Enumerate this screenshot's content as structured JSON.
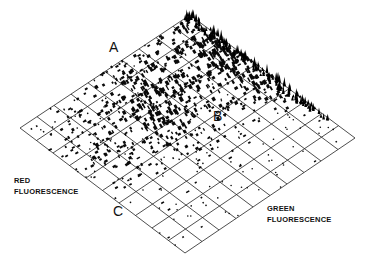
{
  "chart_data": {
    "type": "heatmap",
    "subtype": "3d-isometric-histogram",
    "title": "",
    "xlabel": "GREEN FLUORESCENCE",
    "ylabel": "RED FLUORESCENCE",
    "grid": true,
    "grid_divisions": 10,
    "annotations": [
      {
        "label": "A",
        "description": "ridge of high counts along high red fluorescence edge"
      },
      {
        "label": "B",
        "description": "population toward higher green fluorescence"
      },
      {
        "label": "C",
        "description": "low-count tail near low red fluorescence edge"
      }
    ],
    "colors": {
      "ink": "#111111",
      "background": "#ffffff"
    }
  },
  "labels": {
    "a": "A",
    "b": "B",
    "c": "C",
    "red_axis_line1": "RED",
    "red_axis_line2": "FLUORESCENCE",
    "green_axis_line1": "GREEN",
    "green_axis_line2": "FLUORESCENCE"
  }
}
